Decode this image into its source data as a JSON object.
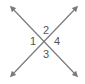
{
  "diagram": {
    "line_color": "#7a7a7a",
    "label_color": "#555555",
    "lines": [
      {
        "name": "line-a",
        "from": [
          12,
          8
        ],
        "to": [
          76,
          75
        ]
      },
      {
        "name": "line-b",
        "from": [
          76,
          8
        ],
        "to": [
          12,
          75
        ]
      }
    ],
    "intersection": [
      44,
      41
    ],
    "angles": [
      {
        "id": "1",
        "label": "1",
        "position": "left",
        "x": 36,
        "y": 45
      },
      {
        "id": "2",
        "label": "2",
        "position": "top",
        "x": 47,
        "y": 33
      },
      {
        "id": "3",
        "label": "3",
        "position": "bottom",
        "x": 47,
        "y": 57
      },
      {
        "id": "4",
        "label": "4",
        "position": "right",
        "x": 58,
        "y": 45
      }
    ]
  }
}
